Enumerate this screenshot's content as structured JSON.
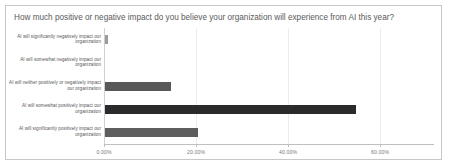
{
  "chart": {
    "title": "How much positive or negative impact do you believe your organization will experience from AI this year?",
    "frame_border_color": "#c8c8c8",
    "background_color": "#ffffff",
    "title_color": "#5a5a5a",
    "gridline_color": "#ededed",
    "axis_color": "#c0c0c0"
  },
  "chart_data": {
    "type": "bar",
    "orientation": "horizontal",
    "title": "How much positive or negative impact do you believe your organization will experience from AI this year?",
    "xlabel": "",
    "ylabel": "",
    "categories": [
      "AI will significantly negatively impact our organization",
      "AI will somewhat negatively impact our organization",
      "AI will neither positively or negatively impact our organization",
      "AI will somewhat positively impact our organization",
      "AI will significantly positively impact our organization"
    ],
    "values": [
      0.6,
      0.0,
      14.3,
      54.5,
      20.2
    ],
    "value_suffix": "%",
    "xlim": [
      0,
      71.7
    ],
    "xticks": [
      0,
      20,
      40,
      60
    ],
    "xtick_labels": [
      "0.00%",
      "20.00%",
      "40.00%",
      "60.00%"
    ],
    "grid": true,
    "legend": null,
    "bar_colors": [
      "#9b9b9b",
      "#9b9b9b",
      "#585858",
      "#2b2b2b",
      "#5e5e5e"
    ]
  }
}
